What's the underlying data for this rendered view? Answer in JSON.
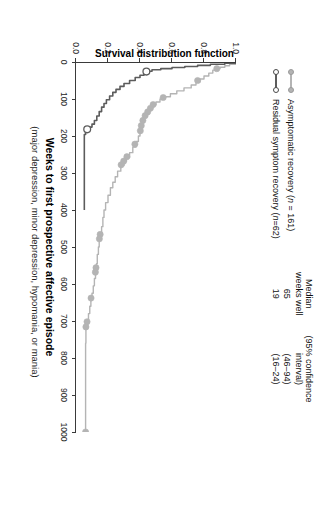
{
  "figure": {
    "kind": "survival-curve",
    "background": "#ffffff"
  },
  "chart_data": {
    "type": "line",
    "title": "",
    "xlabel": "Weeks to first prospective affective episode",
    "xlabel_sub": "(major depression, minor depression, hypomania, or mania)",
    "ylabel": "Survival distribution function",
    "xlim": [
      0,
      1000
    ],
    "ylim": [
      0.0,
      1.0
    ],
    "grid": false,
    "legend_position": "top-left",
    "xticks": [
      0,
      100,
      200,
      300,
      400,
      500,
      600,
      700,
      800,
      900,
      1000
    ],
    "xtick_labels": [
      "0",
      "100",
      "200",
      "300",
      "400",
      "500",
      "600",
      "700",
      "800",
      "900",
      "1000"
    ],
    "yticks": [
      0.0,
      0.2,
      0.4,
      0.6,
      0.8,
      1.0
    ],
    "ytick_labels": [
      "0.0",
      "0.2",
      "0.4",
      "0.6",
      "0.8",
      "1.0"
    ],
    "series": [
      {
        "name": "Asymptomatic recovery (n = 161)",
        "color": "#b4b4b4",
        "marker": "filled-circle",
        "median_weeks_well": 65,
        "confidence_interval": "(46–94)",
        "n": 161,
        "points": [
          [
            0,
            1.0
          ],
          [
            6,
            0.96
          ],
          [
            10,
            0.93
          ],
          [
            14,
            0.9
          ],
          [
            18,
            0.88
          ],
          [
            22,
            0.855
          ],
          [
            30,
            0.83
          ],
          [
            38,
            0.8
          ],
          [
            46,
            0.775
          ],
          [
            54,
            0.75
          ],
          [
            62,
            0.72
          ],
          [
            70,
            0.675
          ],
          [
            78,
            0.63
          ],
          [
            86,
            0.59
          ],
          [
            94,
            0.555
          ],
          [
            100,
            0.525
          ],
          [
            108,
            0.5
          ],
          [
            116,
            0.48
          ],
          [
            124,
            0.465
          ],
          [
            132,
            0.45
          ],
          [
            140,
            0.435
          ],
          [
            150,
            0.425
          ],
          [
            160,
            0.415
          ],
          [
            170,
            0.41
          ],
          [
            180,
            0.405
          ],
          [
            190,
            0.4
          ],
          [
            200,
            0.39
          ],
          [
            215,
            0.375
          ],
          [
            230,
            0.355
          ],
          [
            245,
            0.335
          ],
          [
            258,
            0.315
          ],
          [
            268,
            0.3
          ],
          [
            280,
            0.28
          ],
          [
            295,
            0.26
          ],
          [
            310,
            0.245
          ],
          [
            325,
            0.23
          ],
          [
            340,
            0.215
          ],
          [
            360,
            0.2
          ],
          [
            380,
            0.185
          ],
          [
            400,
            0.175
          ],
          [
            420,
            0.168
          ],
          [
            445,
            0.16
          ],
          [
            465,
            0.152
          ],
          [
            480,
            0.145
          ],
          [
            500,
            0.14
          ],
          [
            520,
            0.133
          ],
          [
            545,
            0.128
          ],
          [
            565,
            0.122
          ],
          [
            585,
            0.115
          ],
          [
            605,
            0.108
          ],
          [
            625,
            0.1
          ],
          [
            640,
            0.093
          ],
          [
            660,
            0.086
          ],
          [
            680,
            0.078
          ],
          [
            700,
            0.07
          ],
          [
            715,
            0.062
          ],
          [
            760,
            0.06
          ],
          [
            860,
            0.06
          ],
          [
            960,
            0.06
          ],
          [
            1000,
            0.06
          ]
        ],
        "censored_marks": [
          [
            18,
            0.88
          ],
          [
            50,
            0.76
          ],
          [
            96,
            0.545
          ],
          [
            115,
            0.482
          ],
          [
            125,
            0.465
          ],
          [
            135,
            0.448
          ],
          [
            145,
            0.432
          ],
          [
            158,
            0.418
          ],
          [
            172,
            0.408
          ],
          [
            186,
            0.402
          ],
          [
            222,
            0.368
          ],
          [
            256,
            0.318
          ],
          [
            268,
            0.298
          ],
          [
            278,
            0.282
          ],
          [
            466,
            0.151
          ],
          [
            478,
            0.146
          ],
          [
            556,
            0.125
          ],
          [
            568,
            0.121
          ],
          [
            638,
            0.094
          ],
          [
            702,
            0.069
          ],
          [
            716,
            0.062
          ],
          [
            1000,
            0.06
          ]
        ]
      },
      {
        "name": "Residual symptom recovery (n = 62)",
        "color": "#5c5c5c",
        "marker": "open-circle",
        "median_weeks_well": 19,
        "confidence_interval": "(16–24)",
        "n": 62,
        "points": [
          [
            0,
            1.0
          ],
          [
            3,
            0.93
          ],
          [
            6,
            0.84
          ],
          [
            9,
            0.76
          ],
          [
            12,
            0.68
          ],
          [
            15,
            0.6
          ],
          [
            18,
            0.53
          ],
          [
            21,
            0.475
          ],
          [
            25,
            0.44
          ],
          [
            30,
            0.425
          ],
          [
            36,
            0.4
          ],
          [
            42,
            0.37
          ],
          [
            50,
            0.335
          ],
          [
            58,
            0.3
          ],
          [
            66,
            0.275
          ],
          [
            74,
            0.25
          ],
          [
            82,
            0.23
          ],
          [
            92,
            0.21
          ],
          [
            102,
            0.19
          ],
          [
            112,
            0.175
          ],
          [
            122,
            0.16
          ],
          [
            134,
            0.145
          ],
          [
            146,
            0.13
          ],
          [
            158,
            0.115
          ],
          [
            168,
            0.1
          ],
          [
            176,
            0.085
          ],
          [
            182,
            0.07
          ],
          [
            188,
            0.06
          ],
          [
            196,
            0.052
          ],
          [
            240,
            0.052
          ],
          [
            320,
            0.052
          ],
          [
            400,
            0.052
          ]
        ],
        "censored_marks": [
          [
            26,
            0.44
          ],
          [
            182,
            0.07
          ]
        ]
      }
    ]
  },
  "stats_table": {
    "headers": [
      "Median\nweeks well",
      "(95% confidence\ninterval)"
    ],
    "header_median_line1": "Median",
    "header_median_line2": "weeks well",
    "header_ci_line1": "(95% confidence",
    "header_ci_line2": "interval)",
    "rows": [
      {
        "median": "65",
        "ci": "(46–94)"
      },
      {
        "median": "19",
        "ci": "(16–24)"
      }
    ]
  },
  "legend": {
    "items": [
      {
        "label_pre": "Asymptomatic recovery (",
        "label_ital": "n",
        "label_post": " = 161)",
        "full": "Asymptomatic recovery (n = 161)",
        "color": "#b4b4b4",
        "marker": "filled-circle"
      },
      {
        "label_pre": "Residual symptom recovery (",
        "label_ital": "n",
        "label_post": "=62)",
        "full": "Residual symptom recovery (n=62)",
        "color": "#5c5c5c",
        "marker": "open-circle"
      }
    ]
  },
  "colors": {
    "asymptomatic": "#b4b4b4",
    "residual": "#5c5c5c",
    "axis": "#3a3a3a",
    "text": "#111111"
  }
}
